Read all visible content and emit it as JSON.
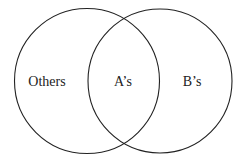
{
  "diagram": {
    "type": "venn",
    "sets": [
      {
        "name": "left-circle",
        "cx": 87,
        "cy": 81,
        "r": 73
      },
      {
        "name": "right-circle",
        "cx": 160,
        "cy": 81,
        "r": 72
      }
    ],
    "labels": {
      "left_only": "Others",
      "intersection": "A’s",
      "right_only": "B’s"
    },
    "stroke_color": "#222222"
  }
}
